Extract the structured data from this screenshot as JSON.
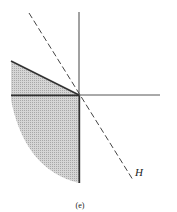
{
  "figure": {
    "caption": "(e)",
    "line_label": "H",
    "colors": {
      "background": "#ffffff",
      "ink": "#333333",
      "shade": "#c8c8c8"
    },
    "elements": [
      "vertical axis",
      "horizontal axis",
      "solid ray from origin to upper-left",
      "dashed line H through origin",
      "shaded region below-left of origin bounded by arc"
    ]
  }
}
